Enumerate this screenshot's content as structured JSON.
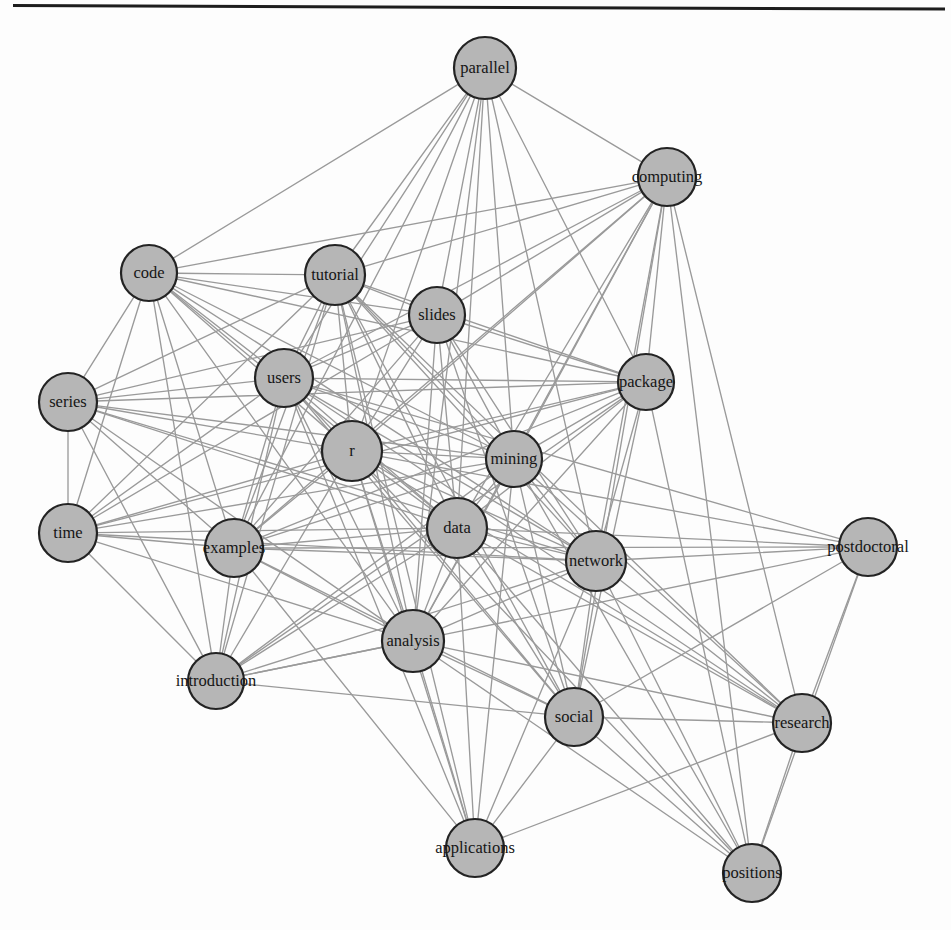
{
  "figure": {
    "type": "network-graph",
    "background_color": "#fdfdfd",
    "rule_color": "#1d1d1d",
    "node_fill": "#b6b6b6",
    "node_stroke": "#232323",
    "edge_color": "#9a9a9a",
    "label_color": "#151515",
    "width": 951,
    "height": 930
  },
  "chart_data": {
    "type": "network",
    "title": "",
    "subtitle": "",
    "xlabel": "",
    "ylabel": "",
    "grid": false,
    "legend": null,
    "layout": "force-directed",
    "node_count": 21,
    "edge_count": 133,
    "nodes": [
      {
        "id": "parallel",
        "label": "parallel",
        "x": 485,
        "y": 68,
        "r": 31
      },
      {
        "id": "computing",
        "label": "computing",
        "x": 667,
        "y": 177,
        "r": 29
      },
      {
        "id": "code",
        "label": "code",
        "x": 149,
        "y": 273,
        "r": 28
      },
      {
        "id": "tutorial",
        "label": "tutorial",
        "x": 335,
        "y": 275,
        "r": 30
      },
      {
        "id": "slides",
        "label": "slides",
        "x": 437,
        "y": 315,
        "r": 28
      },
      {
        "id": "users",
        "label": "users",
        "x": 284,
        "y": 378,
        "r": 29
      },
      {
        "id": "package",
        "label": "package",
        "x": 646,
        "y": 382,
        "r": 28
      },
      {
        "id": "series",
        "label": "series",
        "x": 68,
        "y": 402,
        "r": 29
      },
      {
        "id": "r",
        "label": "r",
        "x": 352,
        "y": 451,
        "r": 30
      },
      {
        "id": "mining",
        "label": "mining",
        "x": 514,
        "y": 459,
        "r": 28
      },
      {
        "id": "data",
        "label": "data",
        "x": 457,
        "y": 528,
        "r": 30
      },
      {
        "id": "time",
        "label": "time",
        "x": 68,
        "y": 533,
        "r": 29
      },
      {
        "id": "examples",
        "label": "examples",
        "x": 234,
        "y": 548,
        "r": 29
      },
      {
        "id": "postdoctoral",
        "label": "postdoctoral",
        "x": 868,
        "y": 547,
        "r": 29
      },
      {
        "id": "network",
        "label": "network",
        "x": 596,
        "y": 561,
        "r": 30
      },
      {
        "id": "analysis",
        "label": "analysis",
        "x": 413,
        "y": 641,
        "r": 31
      },
      {
        "id": "introduction",
        "label": "introduction",
        "x": 216,
        "y": 681,
        "r": 28
      },
      {
        "id": "social",
        "label": "social",
        "x": 574,
        "y": 717,
        "r": 29
      },
      {
        "id": "research",
        "label": "research",
        "x": 802,
        "y": 723,
        "r": 29
      },
      {
        "id": "applications",
        "label": "applications",
        "x": 475,
        "y": 848,
        "r": 29
      },
      {
        "id": "positions",
        "label": "positions",
        "x": 752,
        "y": 873,
        "r": 29
      }
    ],
    "edges": [
      [
        "parallel",
        "computing"
      ],
      [
        "parallel",
        "tutorial"
      ],
      [
        "parallel",
        "users"
      ],
      [
        "parallel",
        "r"
      ],
      [
        "parallel",
        "data"
      ],
      [
        "parallel",
        "examples"
      ],
      [
        "parallel",
        "analysis"
      ],
      [
        "parallel",
        "mining"
      ],
      [
        "parallel",
        "slides"
      ],
      [
        "parallel",
        "package"
      ],
      [
        "parallel",
        "network"
      ],
      [
        "parallel",
        "code"
      ],
      [
        "computing",
        "tutorial"
      ],
      [
        "computing",
        "users"
      ],
      [
        "computing",
        "r"
      ],
      [
        "computing",
        "data"
      ],
      [
        "computing",
        "examples"
      ],
      [
        "computing",
        "analysis"
      ],
      [
        "computing",
        "mining"
      ],
      [
        "computing",
        "package"
      ],
      [
        "computing",
        "network"
      ],
      [
        "computing",
        "slides"
      ],
      [
        "computing",
        "code"
      ],
      [
        "computing",
        "positions"
      ],
      [
        "computing",
        "research"
      ],
      [
        "computing",
        "social"
      ],
      [
        "code",
        "tutorial"
      ],
      [
        "code",
        "users"
      ],
      [
        "code",
        "r"
      ],
      [
        "code",
        "data"
      ],
      [
        "code",
        "examples"
      ],
      [
        "code",
        "analysis"
      ],
      [
        "code",
        "series"
      ],
      [
        "code",
        "time"
      ],
      [
        "code",
        "introduction"
      ],
      [
        "code",
        "mining"
      ],
      [
        "code",
        "slides"
      ],
      [
        "code",
        "package"
      ],
      [
        "code",
        "network"
      ],
      [
        "tutorial",
        "users"
      ],
      [
        "tutorial",
        "r"
      ],
      [
        "tutorial",
        "data"
      ],
      [
        "tutorial",
        "examples"
      ],
      [
        "tutorial",
        "analysis"
      ],
      [
        "tutorial",
        "series"
      ],
      [
        "tutorial",
        "time"
      ],
      [
        "tutorial",
        "introduction"
      ],
      [
        "tutorial",
        "mining"
      ],
      [
        "tutorial",
        "slides"
      ],
      [
        "tutorial",
        "package"
      ],
      [
        "tutorial",
        "network"
      ],
      [
        "tutorial",
        "social"
      ],
      [
        "tutorial",
        "applications"
      ],
      [
        "tutorial",
        "research"
      ],
      [
        "slides",
        "users"
      ],
      [
        "slides",
        "r"
      ],
      [
        "slides",
        "data"
      ],
      [
        "slides",
        "examples"
      ],
      [
        "slides",
        "analysis"
      ],
      [
        "slides",
        "mining"
      ],
      [
        "slides",
        "package"
      ],
      [
        "slides",
        "network"
      ],
      [
        "slides",
        "series"
      ],
      [
        "slides",
        "time"
      ],
      [
        "slides",
        "social"
      ],
      [
        "users",
        "r"
      ],
      [
        "users",
        "data"
      ],
      [
        "users",
        "examples"
      ],
      [
        "users",
        "analysis"
      ],
      [
        "users",
        "series"
      ],
      [
        "users",
        "time"
      ],
      [
        "users",
        "introduction"
      ],
      [
        "users",
        "mining"
      ],
      [
        "users",
        "package"
      ],
      [
        "users",
        "network"
      ],
      [
        "users",
        "social"
      ],
      [
        "users",
        "applications"
      ],
      [
        "users",
        "research"
      ],
      [
        "users",
        "postdoctoral"
      ],
      [
        "package",
        "r"
      ],
      [
        "package",
        "data"
      ],
      [
        "package",
        "examples"
      ],
      [
        "package",
        "analysis"
      ],
      [
        "package",
        "mining"
      ],
      [
        "package",
        "network"
      ],
      [
        "package",
        "series"
      ],
      [
        "package",
        "time"
      ],
      [
        "package",
        "social"
      ],
      [
        "package",
        "introduction"
      ],
      [
        "package",
        "positions"
      ],
      [
        "series",
        "r"
      ],
      [
        "series",
        "data"
      ],
      [
        "series",
        "examples"
      ],
      [
        "series",
        "analysis"
      ],
      [
        "series",
        "time"
      ],
      [
        "series",
        "mining"
      ],
      [
        "series",
        "network"
      ],
      [
        "series",
        "introduction"
      ],
      [
        "r",
        "data"
      ],
      [
        "r",
        "examples"
      ],
      [
        "r",
        "analysis"
      ],
      [
        "r",
        "mining"
      ],
      [
        "r",
        "time"
      ],
      [
        "r",
        "introduction"
      ],
      [
        "r",
        "network"
      ],
      [
        "r",
        "social"
      ],
      [
        "r",
        "applications"
      ],
      [
        "r",
        "postdoctoral"
      ],
      [
        "r",
        "research"
      ],
      [
        "r",
        "positions"
      ],
      [
        "mining",
        "data"
      ],
      [
        "mining",
        "examples"
      ],
      [
        "mining",
        "analysis"
      ],
      [
        "mining",
        "network"
      ],
      [
        "mining",
        "time"
      ],
      [
        "mining",
        "social"
      ],
      [
        "mining",
        "introduction"
      ],
      [
        "mining",
        "applications"
      ],
      [
        "mining",
        "research"
      ],
      [
        "mining",
        "positions"
      ],
      [
        "data",
        "examples"
      ],
      [
        "data",
        "analysis"
      ],
      [
        "data",
        "time"
      ],
      [
        "data",
        "network"
      ],
      [
        "data",
        "introduction"
      ],
      [
        "data",
        "social"
      ],
      [
        "data",
        "applications"
      ],
      [
        "data",
        "research"
      ],
      [
        "data",
        "positions"
      ],
      [
        "data",
        "postdoctoral"
      ],
      [
        "time",
        "examples"
      ],
      [
        "time",
        "analysis"
      ],
      [
        "time",
        "introduction"
      ],
      [
        "time",
        "network"
      ],
      [
        "examples",
        "analysis"
      ],
      [
        "examples",
        "introduction"
      ],
      [
        "examples",
        "network"
      ],
      [
        "examples",
        "social"
      ],
      [
        "examples",
        "applications"
      ],
      [
        "network",
        "analysis"
      ],
      [
        "network",
        "social"
      ],
      [
        "network",
        "postdoctoral"
      ],
      [
        "network",
        "research"
      ],
      [
        "network",
        "positions"
      ],
      [
        "network",
        "applications"
      ],
      [
        "network",
        "introduction"
      ],
      [
        "postdoctoral",
        "analysis"
      ],
      [
        "postdoctoral",
        "research"
      ],
      [
        "postdoctoral",
        "positions"
      ],
      [
        "postdoctoral",
        "social"
      ],
      [
        "postdoctoral",
        "examples"
      ],
      [
        "analysis",
        "introduction"
      ],
      [
        "analysis",
        "social"
      ],
      [
        "analysis",
        "applications"
      ],
      [
        "analysis",
        "research"
      ],
      [
        "analysis",
        "positions"
      ],
      [
        "introduction",
        "social"
      ],
      [
        "introduction",
        "analysis"
      ],
      [
        "social",
        "research"
      ],
      [
        "social",
        "positions"
      ],
      [
        "social",
        "applications"
      ],
      [
        "research",
        "positions"
      ],
      [
        "research",
        "applications"
      ]
    ]
  }
}
